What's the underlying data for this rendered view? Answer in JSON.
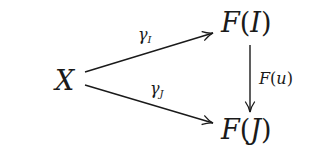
{
  "diagram": {
    "type": "commutative-diagram",
    "nodes": {
      "x": {
        "symbol": "X"
      },
      "fi": {
        "func": "F",
        "open": "(",
        "arg": "I",
        "close": ")"
      },
      "fj": {
        "func": "F",
        "open": "(",
        "arg": "J",
        "close": ")"
      }
    },
    "arrows": {
      "gamma_i": {
        "from": "X",
        "to": "F(I)",
        "base": "γ",
        "sub": "I"
      },
      "gamma_j": {
        "from": "X",
        "to": "F(J)",
        "base": "γ",
        "sub": "J"
      },
      "f_u": {
        "from": "F(I)",
        "to": "F(J)",
        "func": "F",
        "open": "(",
        "arg": "u",
        "close": ")"
      }
    },
    "colors": {
      "ink": "#1a1a1a",
      "background": "#ffffff"
    }
  }
}
